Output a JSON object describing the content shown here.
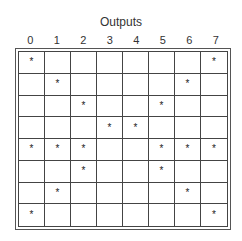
{
  "title": "Outputs",
  "columns": [
    "0",
    "1",
    "2",
    "3",
    "4",
    "5",
    "6",
    "7"
  ],
  "marker": "*",
  "rows": [
    [
      1,
      0,
      0,
      0,
      0,
      0,
      0,
      1
    ],
    [
      0,
      1,
      0,
      0,
      0,
      0,
      1,
      0
    ],
    [
      0,
      0,
      1,
      0,
      0,
      1,
      0,
      0
    ],
    [
      0,
      0,
      0,
      1,
      1,
      0,
      0,
      0
    ],
    [
      1,
      1,
      1,
      0,
      0,
      1,
      1,
      1
    ],
    [
      0,
      0,
      1,
      0,
      0,
      1,
      0,
      0
    ],
    [
      0,
      1,
      0,
      0,
      0,
      0,
      1,
      0
    ],
    [
      1,
      0,
      0,
      0,
      0,
      0,
      0,
      1
    ]
  ]
}
